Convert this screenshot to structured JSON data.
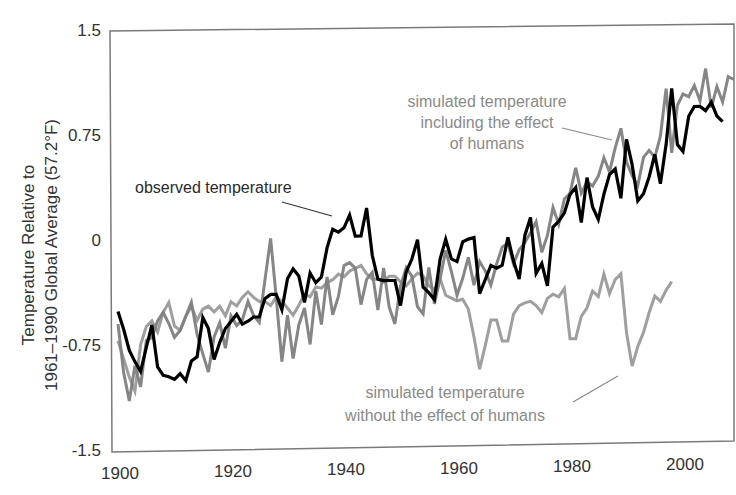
{
  "chart_data": {
    "type": "line",
    "title": "",
    "xlabel": "",
    "ylabel": "Temperature Relative to 1961–1990 Global Average (57.2°F)",
    "ylabel_lines": [
      "Temperature Relative to",
      "1961–1990 Global Average (57.2°F)"
    ],
    "xlim": [
      1900,
      2010
    ],
    "ylim": [
      -1.5,
      1.5
    ],
    "x_ticks": [
      1900,
      1920,
      1940,
      1960,
      1980,
      2000
    ],
    "x_tick_labels": [
      "1900",
      "1920",
      "1940",
      "1960",
      "1980",
      "2000"
    ],
    "y_ticks": [
      1.5,
      0.75,
      0,
      -0.75,
      -1.5
    ],
    "y_tick_labels": [
      "1.5",
      "0.75",
      "0",
      "-0.75",
      "-1.5"
    ],
    "grid": false,
    "legend": "inline annotations",
    "annotations": [
      {
        "id": "observed",
        "lines": [
          "observed temperature"
        ],
        "color": "#2a2a2a"
      },
      {
        "id": "with_humans",
        "lines": [
          "simulated temperature",
          "including the effect",
          "of humans"
        ],
        "color": "#8a8a8a"
      },
      {
        "id": "without_humans",
        "lines": [
          "simulated temperature",
          "without the effect of humans"
        ],
        "color": "#8a8a8a"
      }
    ],
    "series": [
      {
        "name": "observed temperature",
        "color": "#000000",
        "start_year": 1900,
        "values": [
          -0.51,
          -0.64,
          -0.79,
          -0.87,
          -0.94,
          -0.77,
          -0.61,
          -0.91,
          -0.97,
          -0.98,
          -1.0,
          -0.96,
          -1.01,
          -0.87,
          -0.84,
          -0.56,
          -0.64,
          -0.86,
          -0.74,
          -0.64,
          -0.59,
          -0.54,
          -0.61,
          -0.59,
          -0.56,
          -0.56,
          -0.43,
          -0.4,
          -0.4,
          -0.51,
          -0.29,
          -0.22,
          -0.27,
          -0.46,
          -0.25,
          -0.32,
          -0.28,
          -0.07,
          0.06,
          0.04,
          0.07,
          0.16,
          0.01,
          0.01,
          0.21,
          -0.13,
          -0.3,
          -0.31,
          -0.31,
          -0.31,
          -0.49,
          -0.25,
          -0.16,
          -0.02,
          -0.36,
          -0.4,
          -0.45,
          -0.16,
          -0.02,
          -0.16,
          -0.18,
          -0.04,
          -0.02,
          -0.01,
          -0.41,
          -0.31,
          -0.21,
          -0.23,
          -0.21,
          -0.01,
          -0.18,
          -0.31,
          0.0,
          0.13,
          -0.27,
          -0.2,
          -0.36,
          0.06,
          0.1,
          0.16,
          0.29,
          0.34,
          0.09,
          0.41,
          0.2,
          0.11,
          0.29,
          0.43,
          0.47,
          0.26,
          0.68,
          0.5,
          0.24,
          0.29,
          0.41,
          0.57,
          0.36,
          0.64,
          1.04,
          0.64,
          0.59,
          0.84,
          0.91,
          0.91,
          0.88,
          0.94,
          0.84,
          0.8
        ]
      },
      {
        "name": "simulated temperature including the effect of humans",
        "color": "#7f7f7f",
        "start_year": 1900,
        "values": [
          -0.6,
          -0.95,
          -1.15,
          -0.9,
          -1.05,
          -0.72,
          -0.7,
          -0.58,
          -0.52,
          -0.6,
          -0.7,
          -0.65,
          -0.55,
          -0.45,
          -0.68,
          -0.82,
          -0.95,
          -0.7,
          -0.6,
          -0.78,
          -0.55,
          -0.62,
          -0.58,
          -0.45,
          -0.55,
          -0.6,
          -0.3,
          0.0,
          -0.42,
          -0.88,
          -0.55,
          -0.86,
          -0.62,
          -0.5,
          -0.76,
          -0.38,
          -0.62,
          -0.28,
          -0.55,
          -0.42,
          -0.2,
          -0.18,
          -0.22,
          -0.48,
          -0.3,
          -0.25,
          -0.52,
          -0.22,
          -0.5,
          -0.62,
          -0.35,
          -0.22,
          -0.28,
          -0.5,
          -0.55,
          -0.22,
          -0.48,
          -0.3,
          -0.1,
          -0.25,
          -0.42,
          -0.3,
          -0.15,
          -0.35,
          -0.18,
          -0.25,
          -0.35,
          -0.2,
          -0.08,
          -0.05,
          -0.2,
          -0.1,
          -0.05,
          0.02,
          0.1,
          -0.12,
          0.0,
          0.2,
          0.08,
          0.26,
          0.3,
          0.48,
          0.3,
          0.38,
          0.35,
          0.42,
          0.55,
          0.45,
          0.62,
          0.76,
          0.52,
          0.42,
          0.35,
          0.55,
          0.6,
          0.55,
          0.7,
          1.04,
          0.58,
          0.92,
          1.0,
          0.98,
          1.06,
          0.95,
          1.18,
          0.9,
          1.05,
          0.94,
          1.12,
          1.1
        ]
      },
      {
        "name": "simulated temperature without the effect of humans",
        "color": "#9a9a9a",
        "start_year": 1900,
        "values": [
          -0.72,
          -0.85,
          -0.98,
          -1.08,
          -0.75,
          -0.62,
          -0.58,
          -0.66,
          -0.52,
          -0.45,
          -0.62,
          -0.65,
          -0.55,
          -0.48,
          -0.58,
          -0.5,
          -0.48,
          -0.52,
          -0.48,
          -0.55,
          -0.45,
          -0.48,
          -0.42,
          -0.38,
          -0.42,
          -0.45,
          -0.45,
          -0.48,
          -0.42,
          -0.45,
          -0.5,
          -0.55,
          -0.48,
          -0.4,
          -0.42,
          -0.35,
          -0.36,
          -0.32,
          -0.3,
          -0.26,
          -0.28,
          -0.24,
          -0.22,
          -0.2,
          -0.26,
          -0.3,
          -0.3,
          -0.32,
          -0.28,
          -0.28,
          -0.32,
          -0.35,
          -0.3,
          -0.26,
          -0.28,
          -0.35,
          -0.38,
          -0.3,
          -0.42,
          -0.44,
          -0.46,
          -0.45,
          -0.52,
          -0.72,
          -0.95,
          -0.78,
          -0.6,
          -0.6,
          -0.75,
          -0.75,
          -0.56,
          -0.5,
          -0.48,
          -0.47,
          -0.5,
          -0.55,
          -0.45,
          -0.42,
          -0.44,
          -0.38,
          -0.74,
          -0.74,
          -0.58,
          -0.52,
          -0.4,
          -0.44,
          -0.28,
          -0.42,
          -0.32,
          -0.28,
          -0.7,
          -0.94,
          -0.8,
          -0.7,
          -0.56,
          -0.44,
          -0.48,
          -0.4,
          -0.34
        ]
      }
    ]
  },
  "axes": {
    "y_label_line1": "Temperature Relative to",
    "y_label_line2": "1961–1990 Global Average (57.2°F)"
  },
  "labels": {
    "observed": "observed temperature",
    "with_1": "simulated temperature",
    "with_2": "including the effect",
    "with_3": "of humans",
    "without_1": "simulated temperature",
    "without_2": "without the effect of humans"
  }
}
